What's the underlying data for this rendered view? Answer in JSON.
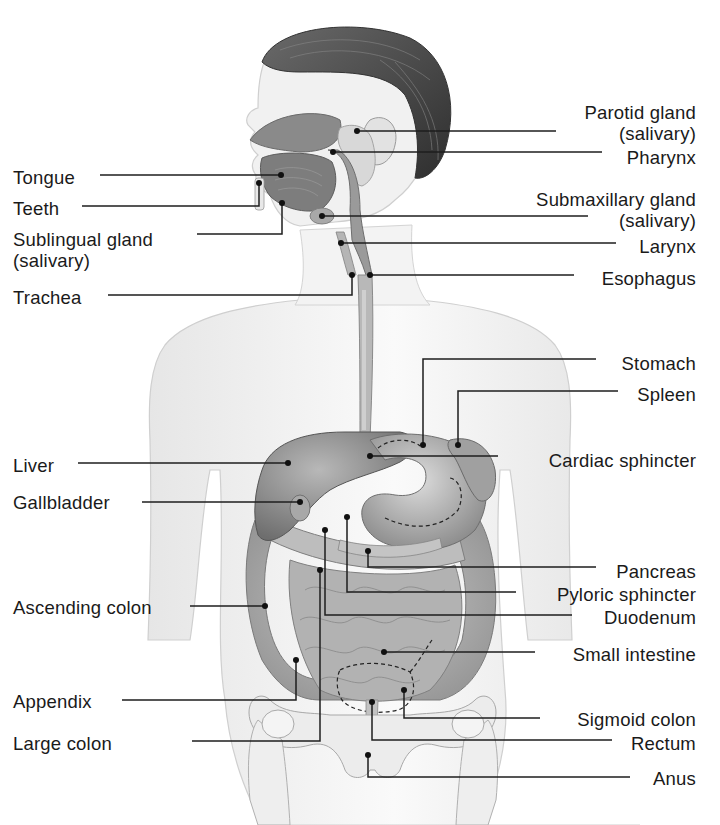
{
  "diagram": {
    "colors": {
      "text": "#1a1a1a",
      "leader_line": "#1e1e1e",
      "skin": "#f2f2f2",
      "skin_outline": "#c8c8c8",
      "hair": "#4a4a4a",
      "organ_dark": "#7a7a7a",
      "organ_mid": "#9a9a9a",
      "organ_light": "#bdbdbd",
      "bone": "#e4e4e4"
    }
  },
  "labels": {
    "left": [
      {
        "id": "tongue",
        "lines": [
          "Tongue"
        ]
      },
      {
        "id": "teeth",
        "lines": [
          "Teeth"
        ]
      },
      {
        "id": "sublingual",
        "lines": [
          "Sublingual gland",
          "(salivary)"
        ]
      },
      {
        "id": "trachea",
        "lines": [
          "Trachea"
        ]
      },
      {
        "id": "liver",
        "lines": [
          "Liver"
        ]
      },
      {
        "id": "gallbladder",
        "lines": [
          "Gallbladder"
        ]
      },
      {
        "id": "ascending_colon",
        "lines": [
          "Ascending colon"
        ]
      },
      {
        "id": "appendix",
        "lines": [
          "Appendix"
        ]
      },
      {
        "id": "large_colon",
        "lines": [
          "Large colon"
        ]
      }
    ],
    "right": [
      {
        "id": "parotid",
        "lines": [
          "Parotid gland",
          "(salivary)"
        ]
      },
      {
        "id": "pharynx",
        "lines": [
          "Pharynx"
        ]
      },
      {
        "id": "submaxillary",
        "lines": [
          "Submaxillary gland",
          "(salivary)"
        ]
      },
      {
        "id": "larynx",
        "lines": [
          "Larynx"
        ]
      },
      {
        "id": "esophagus",
        "lines": [
          "Esophagus"
        ]
      },
      {
        "id": "stomach",
        "lines": [
          "Stomach"
        ]
      },
      {
        "id": "spleen",
        "lines": [
          "Spleen"
        ]
      },
      {
        "id": "cardiac_sphincter",
        "lines": [
          "Cardiac sphincter"
        ]
      },
      {
        "id": "pancreas",
        "lines": [
          "Pancreas"
        ]
      },
      {
        "id": "pyloric_sphincter",
        "lines": [
          "Pyloric sphincter"
        ]
      },
      {
        "id": "duodenum",
        "lines": [
          "Duodenum"
        ]
      },
      {
        "id": "small_intestine",
        "lines": [
          "Small intestine"
        ]
      },
      {
        "id": "sigmoid_colon",
        "lines": [
          "Sigmoid colon"
        ]
      },
      {
        "id": "rectum",
        "lines": [
          "Rectum"
        ]
      },
      {
        "id": "anus",
        "lines": [
          "Anus"
        ]
      }
    ]
  }
}
